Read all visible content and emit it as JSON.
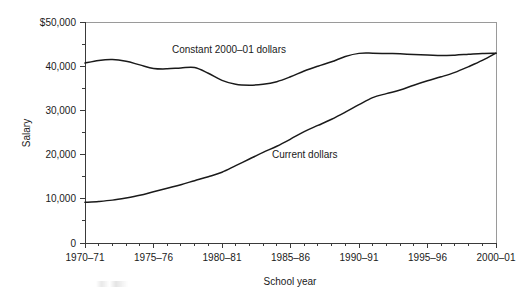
{
  "chart_data": {
    "type": "line",
    "title": "",
    "subtitle": "",
    "xlabel": "School year",
    "ylabel": "Salary",
    "xlim": [
      1970,
      2000
    ],
    "ylim": [
      0,
      50000
    ],
    "grid": false,
    "legend_position": "inline-annotations",
    "y_ticks": [
      {
        "value": 50000,
        "label": "$50,000"
      },
      {
        "value": 40000,
        "label": "40,000"
      },
      {
        "value": 30000,
        "label": "30,000"
      },
      {
        "value": 20000,
        "label": "20,000"
      },
      {
        "value": 10000,
        "label": "10,000"
      },
      {
        "value": 0,
        "label": "0"
      }
    ],
    "y_minor_ticks": [
      5000,
      15000,
      25000,
      35000,
      45000
    ],
    "x_ticks": [
      {
        "value": 1970,
        "label": "1970–71"
      },
      {
        "value": 1975,
        "label": "1975–76"
      },
      {
        "value": 1980,
        "label": "1980–81"
      },
      {
        "value": 1985,
        "label": "1985–86"
      },
      {
        "value": 1990,
        "label": "1990–91"
      },
      {
        "value": 1995,
        "label": "1995–96"
      },
      {
        "value": 2000,
        "label": "2000–01"
      }
    ],
    "x_minor_ticks": [
      1971,
      1972,
      1973,
      1974,
      1976,
      1977,
      1978,
      1979,
      1981,
      1982,
      1983,
      1984,
      1986,
      1987,
      1988,
      1989,
      1991,
      1992,
      1993,
      1994,
      1996,
      1997,
      1998,
      1999
    ],
    "x": [
      1970,
      1971,
      1972,
      1973,
      1974,
      1975,
      1976,
      1977,
      1978,
      1979,
      1980,
      1981,
      1982,
      1983,
      1984,
      1985,
      1986,
      1987,
      1988,
      1989,
      1990,
      1991,
      1992,
      1993,
      1994,
      1995,
      1996,
      1997,
      1998,
      1999,
      2000
    ],
    "series": [
      {
        "name": "Constant 2000–01 dollars",
        "label": "Constant 2000–01 dollars",
        "color": "#1a1a1a",
        "label_x": 172,
        "label_y": 53,
        "values": [
          40700,
          41300,
          41500,
          41100,
          40300,
          39500,
          39400,
          39600,
          39700,
          38400,
          36800,
          35900,
          35700,
          35900,
          36500,
          37600,
          38900,
          40000,
          41000,
          42200,
          42900,
          42950,
          42900,
          42800,
          42650,
          42550,
          42400,
          42500,
          42700,
          42900,
          42950
        ]
      },
      {
        "name": "Current dollars",
        "label": "Current dollars",
        "color": "#1a1a1a",
        "label_x": 272,
        "label_y": 158,
        "values": [
          9200,
          9400,
          9700,
          10200,
          10800,
          11600,
          12400,
          13200,
          14100,
          15000,
          16000,
          17500,
          19000,
          20500,
          21900,
          23500,
          25200,
          26600,
          28000,
          29600,
          31300,
          32900,
          33800,
          34600,
          35700,
          36700,
          37600,
          38600,
          39900,
          41300,
          42950
        ]
      }
    ]
  },
  "geometry": {
    "plot_left": 85,
    "plot_right": 496,
    "plot_top": 22,
    "plot_bottom": 243
  },
  "annotations": {
    "scan_artifact_present": true
  }
}
